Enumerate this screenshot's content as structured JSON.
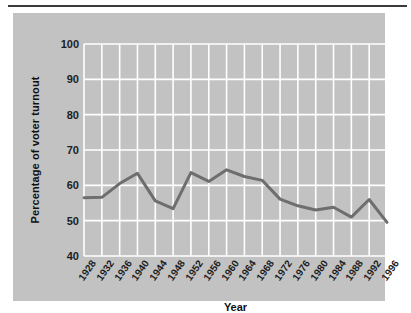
{
  "figure": {
    "background_color": "#c2c2c2",
    "grid_color": "#ffffff",
    "line_color": "#6e6e6e",
    "text_color": "#1d1d1d"
  },
  "chart_data": {
    "type": "line",
    "title": "",
    "xlabel": "Year",
    "ylabel": "Percentage of voter turnout",
    "categories": [
      "1928",
      "1932",
      "1936",
      "1940",
      "1944",
      "1948",
      "1952",
      "1956",
      "1960",
      "1964",
      "1968",
      "1972",
      "1976",
      "1980",
      "1984",
      "1988",
      "1992",
      "1996"
    ],
    "values": [
      56.5,
      56.6,
      60.5,
      63.4,
      55.6,
      53.4,
      63.6,
      61.1,
      64.4,
      62.5,
      61.4,
      56.1,
      54.2,
      53.0,
      53.8,
      51.0,
      56.0,
      49.5
    ],
    "series": [
      {
        "name": "Voter turnout",
        "values": [
          56.5,
          56.6,
          60.5,
          63.4,
          55.6,
          53.4,
          63.6,
          61.1,
          64.4,
          62.5,
          61.4,
          56.1,
          54.2,
          53.0,
          53.8,
          51.0,
          56.0,
          49.5
        ]
      }
    ],
    "ylim": [
      40,
      100
    ],
    "yticks": [
      "40",
      "50",
      "60",
      "70",
      "80",
      "90",
      "100"
    ],
    "xticks": [
      "1928",
      "1932",
      "1936",
      "1940",
      "1944",
      "1948",
      "1952",
      "1956",
      "1960",
      "1964",
      "1968",
      "1972",
      "1976",
      "1980",
      "1984",
      "1988",
      "1992",
      "1996"
    ],
    "grid": true,
    "legend": "none"
  }
}
